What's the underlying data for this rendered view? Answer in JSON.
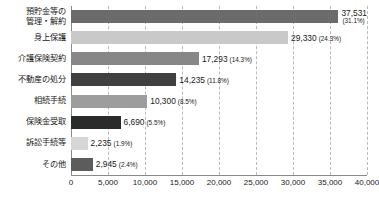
{
  "chart_data": {
    "type": "bar",
    "orientation": "horizontal",
    "title": "",
    "subtitle": "",
    "xlabel": "",
    "ylabel": "",
    "xlim": [
      0,
      40000
    ],
    "grid": true,
    "legend": false,
    "xticks": [
      "0",
      "5,000",
      "10,000",
      "15,000",
      "20,000",
      "25,000",
      "30,000",
      "35,000",
      "40,000"
    ],
    "xtick_values": [
      0,
      5000,
      10000,
      15000,
      20000,
      25000,
      30000,
      35000,
      40000
    ],
    "categories": [
      "預貯金等の\n管理・解約",
      "身上保護",
      "介護保険契約",
      "不動産の処分",
      "相続手続",
      "保険金受取",
      "訴訟手続等",
      "その他"
    ],
    "values": [
      37531,
      29330,
      17293,
      14235,
      10300,
      6690,
      2235,
      2945
    ],
    "value_labels": [
      "37,531",
      "29,330",
      "17,293",
      "14,235",
      "10,300",
      "6,690",
      "2,235",
      "2,945"
    ],
    "percent_labels": [
      "(31.1%)",
      "(24.3%)",
      "(14.3%)",
      "(11.8%)",
      "(8.5%)",
      "(5.5%)",
      "(1.9%)",
      "(2.4%)"
    ],
    "bar_colors": [
      "#6b6b6b",
      "#c9c9c9",
      "#878787",
      "#404040",
      "#9d9d9d",
      "#2b2b2b",
      "#d6d6d6",
      "#5c5c5c"
    ],
    "label_stacked": [
      true,
      false,
      false,
      false,
      false,
      false,
      false,
      false
    ]
  },
  "style": {
    "gridline_color": "#b9b9b9",
    "axis_color": "#8a8a8a",
    "text_color": "#1a1a1a",
    "background": "#ffffff"
  }
}
